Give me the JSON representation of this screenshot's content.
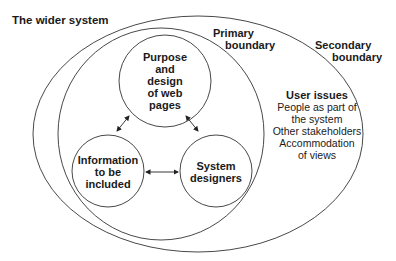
{
  "title": "The wider system",
  "boundaries": {
    "primary": [
      "Primary",
      "boundary"
    ],
    "secondary": [
      "Secondary",
      "boundary"
    ]
  },
  "nodes": {
    "top": [
      "Purpose",
      "and",
      "design",
      "of web",
      "pages"
    ],
    "left": [
      "Information",
      "to be",
      "included"
    ],
    "right": [
      "System",
      "designers"
    ]
  },
  "user_issues": {
    "heading": "User issues",
    "lines": [
      "People as part of",
      "the system",
      "Other stakeholders",
      "Accommodation",
      "of views"
    ]
  },
  "colors": {
    "stroke": "#333333",
    "text": "#1a1a1a",
    "background": "#ffffff"
  }
}
